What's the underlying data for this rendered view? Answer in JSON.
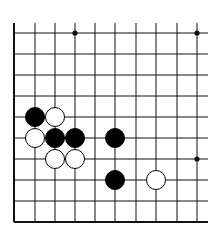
{
  "board": {
    "description": "Go board fragment (lower-left corner region)",
    "background": "#ffffff",
    "line_color": "#111111",
    "columns_x": [
      14,
      35,
      55,
      75,
      95,
      115,
      136,
      156,
      177,
      197
    ],
    "rows_y": [
      33,
      54,
      75,
      96,
      117,
      138,
      159,
      180,
      201,
      222
    ],
    "line_top": 23,
    "line_right": 208,
    "left_edge_x": 14,
    "bottom_edge_y": 222,
    "star_points": [
      [
        3,
        0
      ],
      [
        9,
        0
      ],
      [
        9,
        6
      ]
    ],
    "stones": [
      {
        "col": 1,
        "row": 4,
        "color": "black"
      },
      {
        "col": 2,
        "row": 4,
        "color": "white"
      },
      {
        "col": 1,
        "row": 5,
        "color": "white"
      },
      {
        "col": 2,
        "row": 5,
        "color": "black"
      },
      {
        "col": 3,
        "row": 5,
        "color": "black"
      },
      {
        "col": 5,
        "row": 5,
        "color": "black"
      },
      {
        "col": 2,
        "row": 6,
        "color": "white"
      },
      {
        "col": 3,
        "row": 6,
        "color": "white"
      },
      {
        "col": 5,
        "row": 7,
        "color": "black"
      },
      {
        "col": 7,
        "row": 7,
        "color": "white"
      }
    ],
    "stone_radius": 9.5
  }
}
